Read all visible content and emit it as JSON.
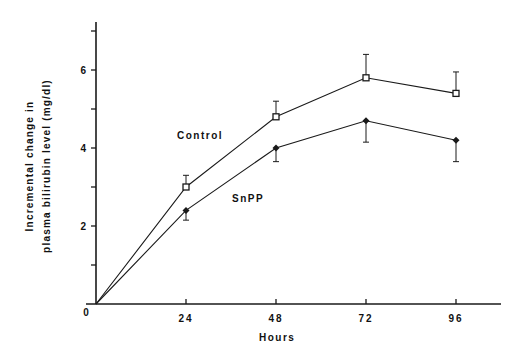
{
  "chart_data": {
    "type": "line",
    "title": "",
    "xlabel": "Hours",
    "ylabel_lines": [
      "Incremental change in",
      "plasma bilirubin level (mg/dl)"
    ],
    "ylabel": "Incremental change in plasma bilirubin level (mg/dl)",
    "x": [
      0,
      24,
      48,
      72,
      96
    ],
    "x_ticks": [
      "0",
      "24",
      "48",
      "72",
      "96"
    ],
    "y_ticks_labeled": [
      "0",
      "2",
      "4",
      "6"
    ],
    "y_tick_values": [
      0,
      1,
      2,
      3,
      4,
      5,
      6,
      7
    ],
    "xlim": [
      0,
      108
    ],
    "ylim": [
      0,
      7.3
    ],
    "grid": false,
    "legend": "inline labels",
    "series": [
      {
        "name": "Control",
        "marker": "open-square",
        "values": [
          0,
          3.0,
          4.8,
          5.8,
          5.4
        ],
        "error_upper": [
          0,
          3.3,
          5.2,
          6.4,
          5.95
        ],
        "error_direction": "up",
        "label_pos": {
          "x": 177,
          "y": 130
        }
      },
      {
        "name": "SnPP",
        "marker": "filled-diamond",
        "values": [
          0,
          2.4,
          4.0,
          4.7,
          4.2
        ],
        "error_lower": [
          0,
          2.15,
          3.65,
          4.15,
          3.65
        ],
        "error_direction": "down",
        "label_pos": {
          "x": 232,
          "y": 193
        }
      }
    ]
  },
  "labels": {
    "x_axis": "Hours",
    "y_axis_line1": "Incremental change in",
    "y_axis_line2": "plasma bilirubin level (mg/dl)",
    "control": "Control",
    "snpp": "SnPP",
    "origin": "0"
  }
}
